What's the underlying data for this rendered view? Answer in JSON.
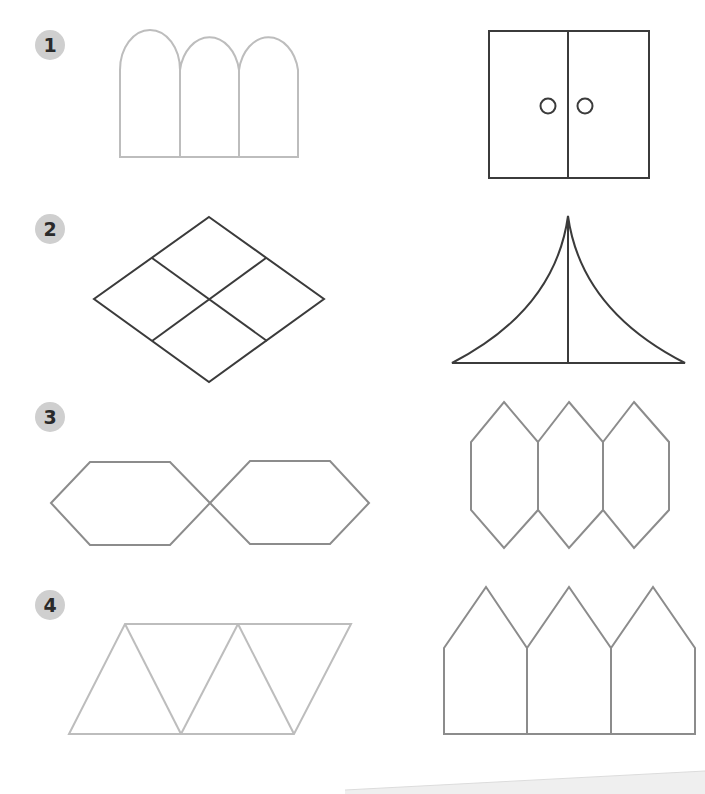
{
  "exercises": [
    {
      "number": "1",
      "left_shape": "three-arches",
      "right_shape": "double-door-square"
    },
    {
      "number": "2",
      "left_shape": "rhombus-divided-into-four",
      "right_shape": "curved-tent-with-center-line"
    },
    {
      "number": "3",
      "left_shape": "two-hexagons-touching",
      "right_shape": "three-tall-hexagons"
    },
    {
      "number": "4",
      "left_shape": "parallelogram-of-four-triangles",
      "right_shape": "three-house-shapes"
    }
  ],
  "colors": {
    "badge_bg": "#cfcfcf",
    "badge_text": "#2a2a2a",
    "stroke_light": "#bdbdbd",
    "stroke_mid": "#8c8c8c",
    "stroke_dark": "#3b3b3b",
    "page_bg": "#ffffff",
    "page_edge_shadow": "#efefef"
  }
}
